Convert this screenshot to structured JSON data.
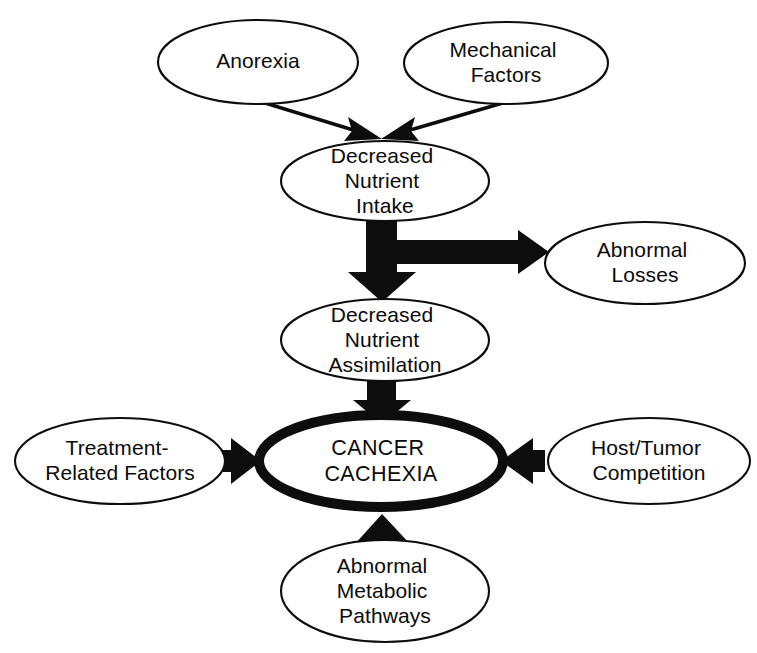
{
  "diagram": {
    "type": "flow-diagram",
    "background_color": "#ffffff",
    "stroke_color": "#0d0d0d",
    "nodes": [
      {
        "id": "anorexia",
        "name": "anorexia",
        "lines": [
          "Anorexia"
        ],
        "emphasis": false,
        "cx": 258,
        "cy": 62,
        "rx": 100,
        "ry": 42
      },
      {
        "id": "mechanical-factors",
        "name": "mechanical-factors",
        "lines": [
          "Mechanical",
          "Factors"
        ],
        "emphasis": false,
        "cx": 506,
        "cy": 63,
        "rx": 102,
        "ry": 41
      },
      {
        "id": "decreased-nutrient-intake",
        "name": "decreased-nutrient-intake",
        "lines": [
          "Decreased",
          "Nutrient",
          "Intake"
        ],
        "emphasis": false,
        "cx": 385,
        "cy": 181,
        "rx": 104,
        "ry": 40
      },
      {
        "id": "abnormal-losses",
        "name": "abnormal-losses",
        "lines": [
          "Abnormal",
          "Losses"
        ],
        "emphasis": false,
        "cx": 645,
        "cy": 263,
        "rx": 100,
        "ry": 41
      },
      {
        "id": "decreased-nutrient-assimilation",
        "name": "decreased-nutrient-assimilation",
        "lines": [
          "Decreased",
          "Nutrient",
          "Assimilation"
        ],
        "emphasis": false,
        "cx": 385,
        "cy": 340,
        "rx": 104,
        "ry": 41
      },
      {
        "id": "treatment-related-factors",
        "name": "treatment-related-factors",
        "lines": [
          "Treatment-",
          "Related Factors"
        ],
        "emphasis": false,
        "cx": 120,
        "cy": 461,
        "rx": 105,
        "ry": 43
      },
      {
        "id": "cancer-cachexia",
        "name": "cancer-cachexia",
        "lines": [
          "CANCER",
          "CACHEXIA"
        ],
        "emphasis": true,
        "cx": 381,
        "cy": 461,
        "rx": 122,
        "ry": 46
      },
      {
        "id": "host-tumor-competition",
        "name": "host-tumor-competition",
        "lines": [
          "Host/Tumor",
          "Competition"
        ],
        "emphasis": false,
        "cx": 649,
        "cy": 461,
        "rx": 101,
        "ry": 43
      },
      {
        "id": "abnormal-metabolic-pathways",
        "name": "abnormal-metabolic-pathways",
        "lines": [
          "Abnormal",
          "Metabolic",
          "Pathways"
        ],
        "emphasis": false,
        "cx": 385,
        "cy": 591,
        "rx": 104,
        "ry": 51
      }
    ],
    "edges": [
      {
        "id": "anorexia-to-intake",
        "name": "arrow-anorexia-to-intake",
        "style": "thin",
        "from": "anorexia",
        "to": "decreased-nutrient-intake"
      },
      {
        "id": "mechanical-to-intake",
        "name": "arrow-mechanical-factors-to-intake",
        "style": "thin",
        "from": "mechanical-factors",
        "to": "decreased-nutrient-intake"
      },
      {
        "id": "intake-to-assimilation",
        "name": "arrow-intake-to-assimilation",
        "style": "thick",
        "from": "decreased-nutrient-intake",
        "to": "decreased-nutrient-assimilation"
      },
      {
        "id": "intake-to-losses",
        "name": "arrow-intake-to-abnormal-losses",
        "style": "thick",
        "from": "decreased-nutrient-intake",
        "to": "abnormal-losses"
      },
      {
        "id": "assimilation-to-cachexia",
        "name": "arrow-assimilation-to-cancer-cachexia",
        "style": "thick",
        "from": "decreased-nutrient-assimilation",
        "to": "cancer-cachexia"
      },
      {
        "id": "treatment-to-cachexia",
        "name": "arrow-treatment-related-factors-to-cancer-cachexia",
        "style": "thick",
        "from": "treatment-related-factors",
        "to": "cancer-cachexia"
      },
      {
        "id": "host-to-cachexia",
        "name": "arrow-host-tumor-competition-to-cancer-cachexia",
        "style": "thick",
        "from": "host-tumor-competition",
        "to": "cancer-cachexia"
      },
      {
        "id": "metabolic-to-cachexia",
        "name": "arrow-abnormal-metabolic-pathways-to-cancer-cachexia",
        "style": "thick",
        "from": "abnormal-metabolic-pathways",
        "to": "cancer-cachexia"
      }
    ]
  }
}
